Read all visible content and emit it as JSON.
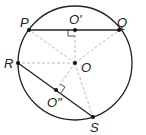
{
  "diagram": {
    "labels": {
      "P": "P",
      "Q": "Q",
      "R": "R",
      "S": "S",
      "O": "O",
      "O1": "O'",
      "O2": "O\""
    },
    "colors": {
      "stroke": "#222222",
      "dashed": "#bbbbbb"
    }
  }
}
